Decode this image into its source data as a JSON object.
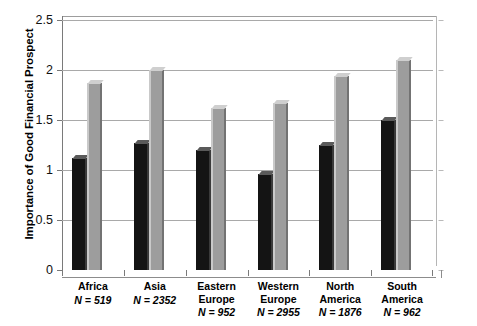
{
  "chart_data": {
    "type": "bar",
    "title": "",
    "subtitle": "",
    "xlabel": "",
    "ylabel": "Importance of Good Financial Prospect",
    "ylim": [
      0,
      2.5
    ],
    "yticks": [
      "0",
      "0.5",
      "1",
      "1.5",
      "2",
      "2.5"
    ],
    "ytick_values": [
      0,
      0.5,
      1,
      1.5,
      2,
      2.5
    ],
    "grid": true,
    "legend_position": "none",
    "categories": [
      "Africa",
      "Asia",
      "Eastern Europe",
      "Western Europe",
      "North America",
      "South America"
    ],
    "category_lines": [
      [
        "Africa"
      ],
      [
        "Asia"
      ],
      [
        "Eastern",
        "Europe"
      ],
      [
        "Western",
        "Europe"
      ],
      [
        "North",
        "America"
      ],
      [
        "South",
        "America"
      ]
    ],
    "sample_sizes": [
      "519",
      "2352",
      "952",
      "2955",
      "1876",
      "962"
    ],
    "sample_size_prefix": "N =",
    "series": [
      {
        "name": "Male",
        "color": "#141414",
        "values": [
          1.12,
          1.27,
          1.2,
          0.96,
          1.25,
          1.5
        ]
      },
      {
        "name": "Female",
        "color": "#9d9d9d",
        "values": [
          1.87,
          2.0,
          1.62,
          1.67,
          1.94,
          2.1
        ]
      }
    ]
  }
}
